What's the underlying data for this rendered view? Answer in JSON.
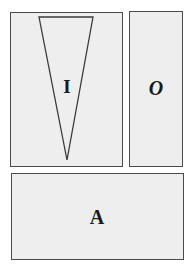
{
  "diagram": {
    "boxes": [
      {
        "id": "I",
        "label": "I",
        "style": "bold"
      },
      {
        "id": "O",
        "label": "O",
        "style": "bold-italic"
      },
      {
        "id": "A",
        "label": "A",
        "style": "bold"
      }
    ],
    "shapes": [
      {
        "type": "inverted-triangle",
        "inside": "I"
      }
    ],
    "colors": {
      "box_fill": "#eeeeee",
      "box_border": "#4a4a4a",
      "text": "#1a1a1a",
      "background": "#ffffff"
    }
  }
}
